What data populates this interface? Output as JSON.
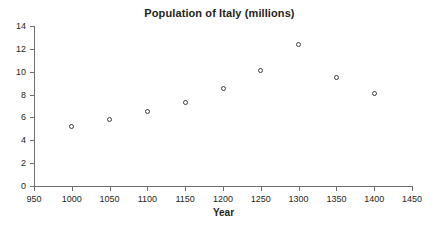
{
  "chart_data": {
    "type": "scatter",
    "title": "Population of Italy (millions)",
    "xlabel": "Year",
    "ylabel": "",
    "x": [
      1000,
      1050,
      1100,
      1150,
      1200,
      1250,
      1300,
      1350,
      1400
    ],
    "values": [
      5.2,
      5.8,
      6.5,
      7.3,
      8.5,
      10.1,
      12.4,
      9.5,
      8.1
    ],
    "xlim": [
      950,
      1450
    ],
    "ylim": [
      0,
      14
    ],
    "xticks": [
      950,
      1000,
      1050,
      1100,
      1150,
      1200,
      1250,
      1300,
      1350,
      1400,
      1450
    ],
    "yticks": [
      0,
      2,
      4,
      6,
      8,
      10,
      12,
      14
    ],
    "grid": false,
    "legend": null,
    "marker": "open-circle",
    "marker_color": "#3b3b3d"
  }
}
